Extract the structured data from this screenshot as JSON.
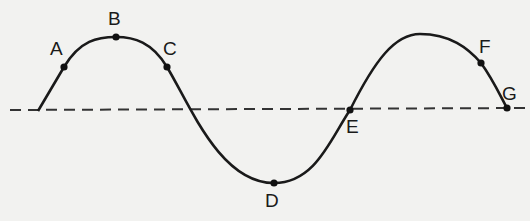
{
  "diagram": {
    "type": "wave",
    "colors": {
      "background": "#f2f2f0",
      "line": "#1a1a1a",
      "dashed": "#333333"
    },
    "points": [
      {
        "label": "A",
        "x": 64,
        "y": 67,
        "lx": 50,
        "ly": 38
      },
      {
        "label": "B",
        "x": 116,
        "y": 37,
        "lx": 108,
        "ly": 9
      },
      {
        "label": "C",
        "x": 167,
        "y": 67,
        "lx": 163,
        "ly": 38
      },
      {
        "label": "D",
        "x": 274,
        "y": 183,
        "lx": 265,
        "ly": 191
      },
      {
        "label": "E",
        "x": 350,
        "y": 110,
        "lx": 346,
        "ly": 117
      },
      {
        "label": "F",
        "x": 481,
        "y": 63,
        "lx": 479,
        "ly": 37
      },
      {
        "label": "G",
        "x": 507,
        "y": 108,
        "lx": 502,
        "ly": 84
      }
    ]
  }
}
